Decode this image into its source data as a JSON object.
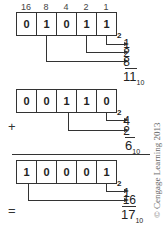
{
  "weights": [
    "16",
    "8",
    "4",
    "2",
    "1"
  ],
  "addend1": {
    "bits": [
      "0",
      "1",
      "0",
      "1",
      "1"
    ],
    "base": "2",
    "terms": [
      "1",
      "2",
      "8"
    ],
    "decimal": "11",
    "decimal_base": "10"
  },
  "addend2": {
    "operator": "+",
    "bits": [
      "0",
      "0",
      "1",
      "1",
      "0"
    ],
    "base": "2",
    "terms": [
      "4",
      "2"
    ],
    "decimal": "6",
    "decimal_base": "10"
  },
  "result": {
    "operator": "=",
    "bits": [
      "1",
      "0",
      "0",
      "0",
      "1"
    ],
    "base": "2",
    "terms": [
      "1",
      "16"
    ],
    "decimal": "17",
    "decimal_base": "10"
  },
  "credit": "© Cengage Learning 2013"
}
